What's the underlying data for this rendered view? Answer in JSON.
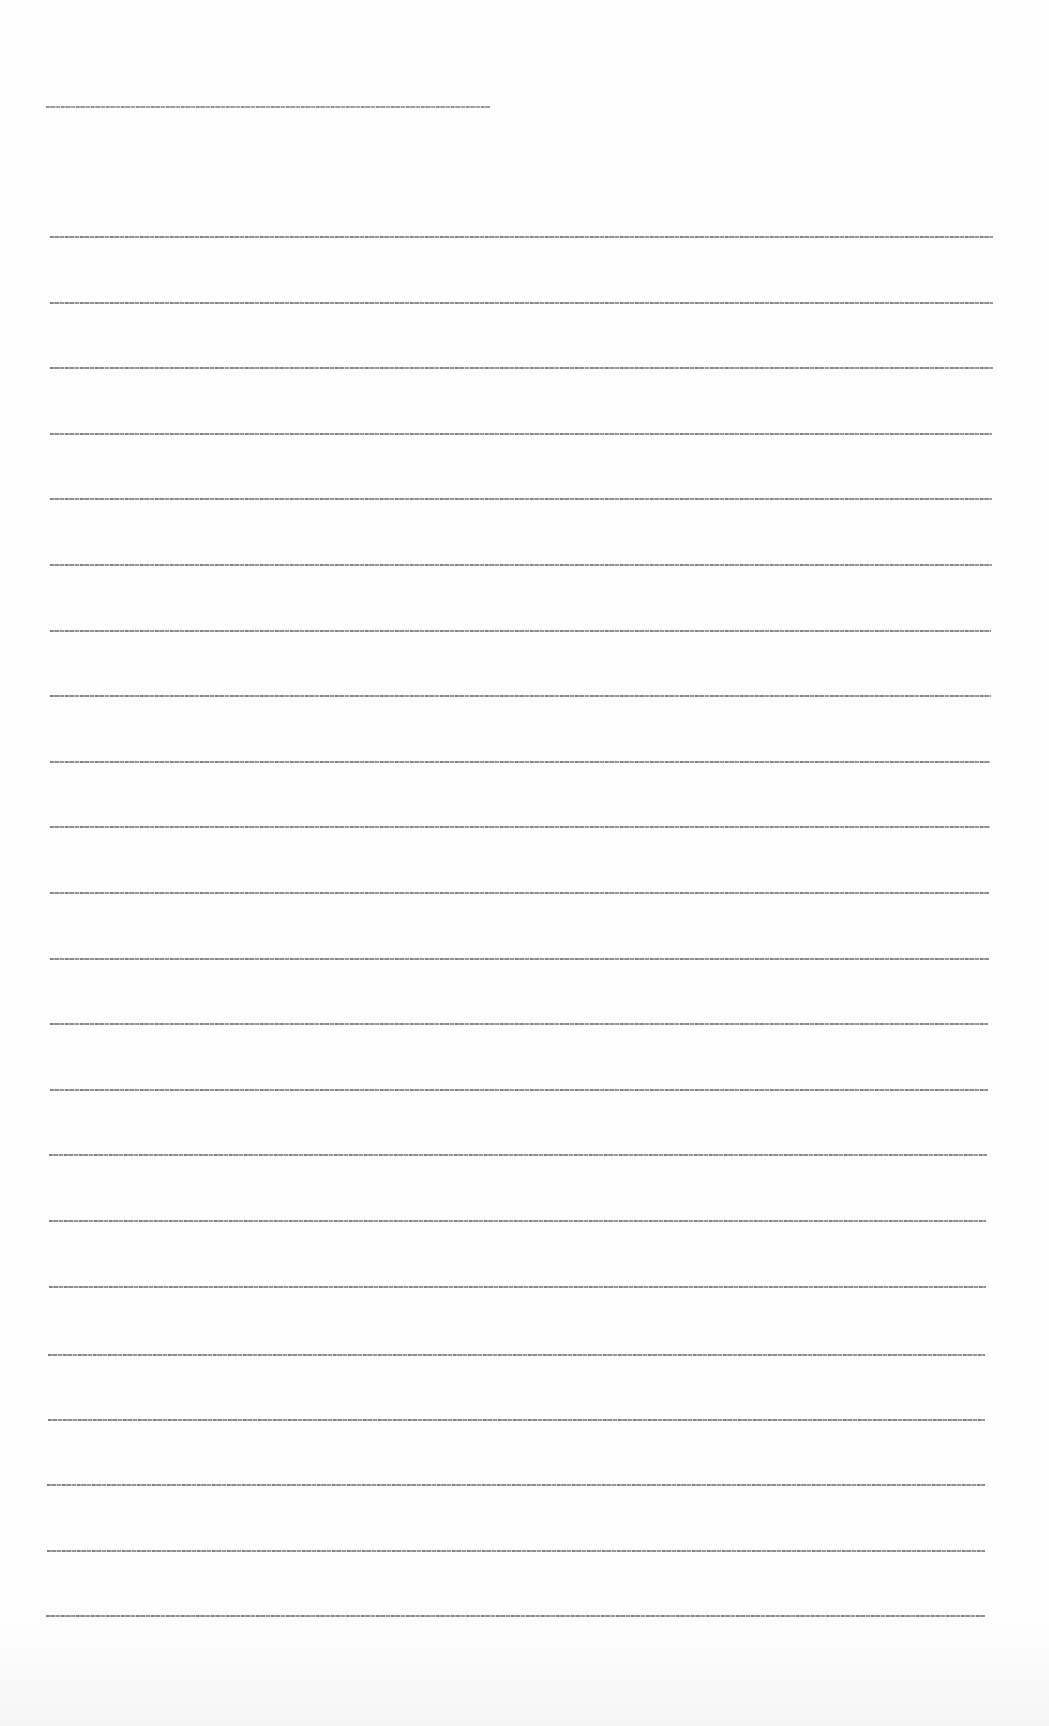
{
  "document": {
    "type": "scanned-text-page",
    "legible": false,
    "heading_line": {
      "text": "[illegible]",
      "x": 46,
      "y": 106,
      "width": 444
    },
    "body_lines": [
      {
        "text": "[illegible]",
        "x": 50,
        "y": 236,
        "width": 943
      },
      {
        "text": "[illegible]",
        "x": 50,
        "y": 302,
        "width": 943
      },
      {
        "text": "[illegible]",
        "x": 50,
        "y": 367,
        "width": 943
      },
      {
        "text": "[illegible]",
        "x": 50,
        "y": 433,
        "width": 942
      },
      {
        "text": "[illegible]",
        "x": 50,
        "y": 498,
        "width": 942
      },
      {
        "text": "[illegible]",
        "x": 50,
        "y": 564,
        "width": 942
      },
      {
        "text": "[illegible]",
        "x": 50,
        "y": 630,
        "width": 941
      },
      {
        "text": "[illegible]",
        "x": 50,
        "y": 695,
        "width": 941
      },
      {
        "text": "[illegible]",
        "x": 50,
        "y": 761,
        "width": 940
      },
      {
        "text": "[illegible]",
        "x": 50,
        "y": 826,
        "width": 940
      },
      {
        "text": "[illegible]",
        "x": 50,
        "y": 892,
        "width": 939
      },
      {
        "text": "[illegible]",
        "x": 50,
        "y": 958,
        "width": 939
      },
      {
        "text": "[illegible]",
        "x": 50,
        "y": 1023,
        "width": 938
      },
      {
        "text": "[illegible]",
        "x": 50,
        "y": 1089,
        "width": 938
      },
      {
        "text": "[illegible]",
        "x": 49,
        "y": 1154,
        "width": 938
      },
      {
        "text": "[illegible]",
        "x": 49,
        "y": 1220,
        "width": 937
      },
      {
        "text": "[illegible]",
        "x": 49,
        "y": 1286,
        "width": 937
      },
      {
        "text": "[illegible]",
        "x": 48,
        "y": 1354,
        "width": 937
      },
      {
        "text": "[illegible]",
        "x": 48,
        "y": 1419,
        "width": 937
      },
      {
        "text": "[illegible]",
        "x": 47,
        "y": 1484,
        "width": 938
      },
      {
        "text": "[illegible]",
        "x": 47,
        "y": 1550,
        "width": 938
      },
      {
        "text": "[illegible]",
        "x": 46,
        "y": 1615,
        "width": 939
      }
    ],
    "colors": {
      "paper": "#fefefe",
      "ink": "#7a7a7a"
    }
  }
}
